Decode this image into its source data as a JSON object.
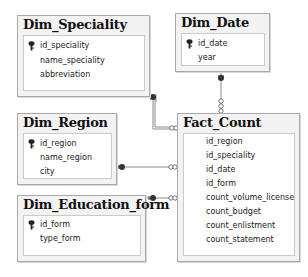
{
  "diagram": {
    "tables": [
      {
        "name": "Dim_Speciality",
        "columns": [
          {
            "name": "id_speciality",
            "primary_key": true
          },
          {
            "name": "name_speciality",
            "primary_key": false
          },
          {
            "name": "abbreviation",
            "primary_key": false
          }
        ]
      },
      {
        "name": "Dim_Date",
        "columns": [
          {
            "name": "id_date",
            "primary_key": true
          },
          {
            "name": "year",
            "primary_key": false
          }
        ]
      },
      {
        "name": "Dim_Region",
        "columns": [
          {
            "name": "id_region",
            "primary_key": true
          },
          {
            "name": "name_region",
            "primary_key": false
          },
          {
            "name": "city",
            "primary_key": false
          }
        ]
      },
      {
        "name": "Dim_Education_form",
        "columns": [
          {
            "name": "id_form",
            "primary_key": true
          },
          {
            "name": "type_form",
            "primary_key": false
          }
        ]
      },
      {
        "name": "Fact_Count",
        "columns": [
          {
            "name": "id_region",
            "primary_key": false
          },
          {
            "name": "id_speciality",
            "primary_key": false
          },
          {
            "name": "id_date",
            "primary_key": false
          },
          {
            "name": "id_form",
            "primary_key": false
          },
          {
            "name": "count_volume_license",
            "primary_key": false
          },
          {
            "name": "count_budget",
            "primary_key": false
          },
          {
            "name": "count_enlistment",
            "primary_key": false
          },
          {
            "name": "count_statement",
            "primary_key": false
          }
        ]
      }
    ],
    "relationships": [
      {
        "from": "Dim_Speciality",
        "to": "Fact_Count",
        "type": "one-to-many"
      },
      {
        "from": "Dim_Date",
        "to": "Fact_Count",
        "type": "one-to-many"
      },
      {
        "from": "Dim_Region",
        "to": "Fact_Count",
        "type": "one-to-many"
      },
      {
        "from": "Dim_Education_form",
        "to": "Fact_Count",
        "type": "one-to-many"
      }
    ],
    "colors": {
      "box_fill": "#f3f3f3",
      "box_border": "#a9a9a9",
      "line": "#808080",
      "endpoint": "#333333"
    }
  }
}
